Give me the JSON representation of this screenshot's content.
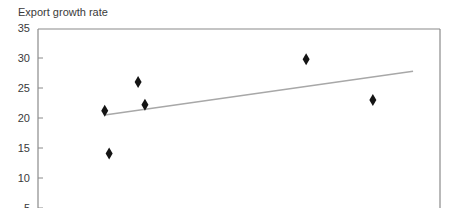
{
  "chart_data": {
    "type": "scatter",
    "title": "",
    "ylabel": "Export growth rate",
    "xlabel": "",
    "ylim": [
      5,
      35
    ],
    "yticks": [
      35,
      30,
      25,
      20,
      15,
      10,
      5
    ],
    "grid": false,
    "legend": null,
    "marker": "diamond",
    "points": [
      {
        "x": 0.166,
        "y": 21.2
      },
      {
        "x": 0.177,
        "y": 14.1
      },
      {
        "x": 0.249,
        "y": 26.0
      },
      {
        "x": 0.266,
        "y": 22.2
      },
      {
        "x": 0.667,
        "y": 29.8
      },
      {
        "x": 0.833,
        "y": 23.0
      }
    ],
    "trendline": {
      "type": "linear",
      "start": {
        "x": 0.166,
        "y": 20.5
      },
      "end": {
        "x": 0.933,
        "y": 27.8
      }
    },
    "note": "x-axis is cropped out of view; x values are normalized positions across plot width (0-1)."
  },
  "colors": {
    "marker": "#141414",
    "trendline": "#a8a8a8",
    "axis": "#8a8a8a",
    "text": "#3a3a3a"
  }
}
